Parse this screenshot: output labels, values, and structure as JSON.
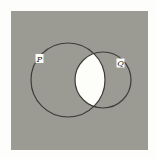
{
  "diagram": {
    "type": "venn",
    "universe": {
      "x": 11,
      "y": 11,
      "width": 137,
      "height": 139,
      "fill": "#9b9a93"
    },
    "shaded_region": "complement of (P ∩ Q)",
    "unshaded_region": "P ∩ Q",
    "intersection_fill": "#fdfdfa",
    "stroke": "#3e3d3a",
    "sets": [
      {
        "name": "P",
        "label": "P",
        "cx": 68,
        "cy": 80,
        "r": 37,
        "label_x": 39.5,
        "label_y": 58.5
      },
      {
        "name": "Q",
        "label": "Q",
        "cx": 103,
        "cy": 80,
        "r": 28,
        "label_x": 120.5,
        "label_y": 63
      }
    ]
  }
}
